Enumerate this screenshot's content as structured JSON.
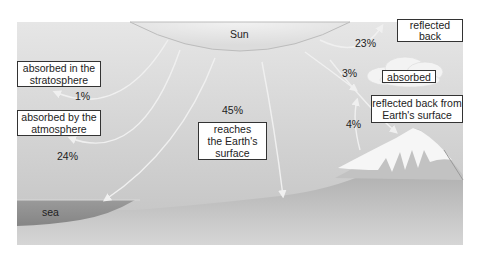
{
  "sun": {
    "label": "Sun"
  },
  "sea": {
    "label": "sea"
  },
  "flows": [
    {
      "id": "stratosphere",
      "percent": "1%",
      "label_lines": [
        "absorbed in the",
        "stratosphere"
      ]
    },
    {
      "id": "atmosphere",
      "percent": "24%",
      "label_lines": [
        "absorbed by the",
        "atmosphere"
      ]
    },
    {
      "id": "surface",
      "percent": "45%",
      "label_lines": [
        "reaches",
        "the Earth's",
        "surface"
      ]
    },
    {
      "id": "reflected-clouds",
      "percent": "23%",
      "label_lines": [
        "reflected",
        "back"
      ]
    },
    {
      "id": "absorbed-clouds",
      "percent": "3%",
      "label_lines": [
        "absorbed"
      ]
    },
    {
      "id": "reflected-surface",
      "percent": "4%",
      "label_lines": [
        "reflected back from",
        "Earth's surface"
      ]
    }
  ],
  "colors": {
    "sky_top": "#e4e4e4",
    "sky_mid": "#cfcfcf",
    "ground": "#b4b4b4",
    "ground_light": "#c9c9c9",
    "sea": "#8e8e8e",
    "arrow": "#eeeeee",
    "snow": "#f7f7f7"
  }
}
